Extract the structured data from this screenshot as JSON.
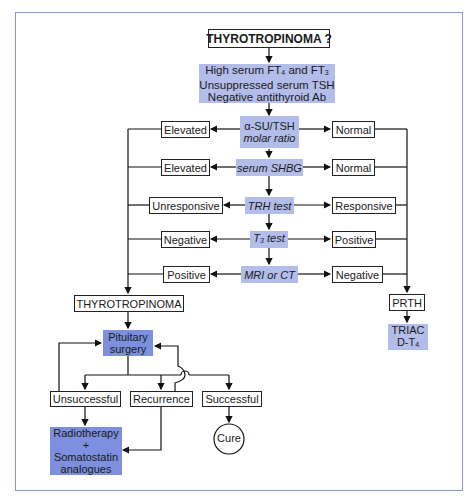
{
  "title": "THYROTROPINOMA ?",
  "initial_findings": [
    "High serum FT4 and FT3",
    "Unsuppressed serum TSH",
    "Negative antithyroid Ab"
  ],
  "tests": [
    {
      "name_line1": "α-SU/TSH",
      "name_line2": "molar ratio",
      "left": "Elevated",
      "right": "Normal"
    },
    {
      "name": "serum SHBG",
      "left": "Elevated",
      "right": "Normal"
    },
    {
      "name": "TRH test",
      "left": "Unresponsive",
      "right": "Responsive"
    },
    {
      "name": "T3 test",
      "left": "Negative",
      "right": "Positive"
    },
    {
      "name": "MRI or CT",
      "left": "Positive",
      "right": "Negative"
    }
  ],
  "left_outcome": "THYROTROPINOMA",
  "right_outcome": "PRTH",
  "right_treatment": [
    "TRIAC",
    "D-T4"
  ],
  "surgery": [
    "Pituitary",
    "surgery"
  ],
  "surgery_outcomes": [
    "Unsuccessful",
    "Recurrence",
    "Successful"
  ],
  "second_line": [
    "Radiotherapy",
    "+",
    "Somatostatin",
    "analogues"
  ],
  "cure": "Cure",
  "colors": {
    "light_box": "#b3bdea",
    "dark_box": "#7d8fde",
    "frame": "#8d97c8"
  }
}
